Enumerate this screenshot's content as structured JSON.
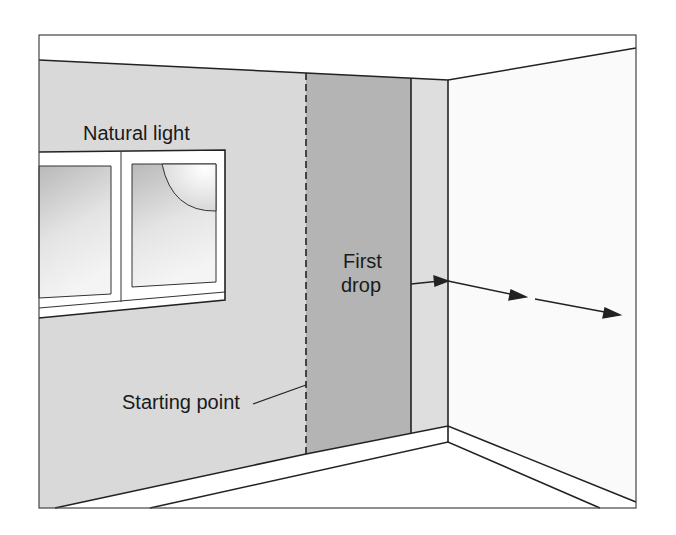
{
  "figure": {
    "labels": {
      "natural_light": "Natural light",
      "first_drop_line1": "First",
      "first_drop_line2": "drop",
      "starting_point": "Starting point"
    },
    "colors": {
      "left_wall": "#d9d9d9",
      "first_drop_strip": "#b4b4b4",
      "light_strip": "#dedede",
      "right_wall": "#fafafa",
      "ceiling": "#ffffff",
      "floor": "#ffffff",
      "line": "#222222"
    }
  }
}
